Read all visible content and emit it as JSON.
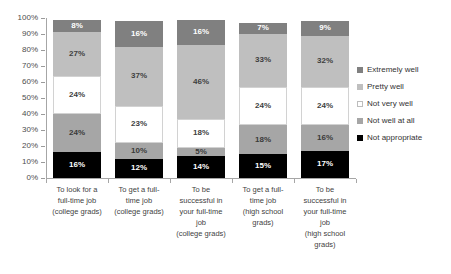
{
  "chart_data": {
    "type": "bar",
    "stacked": true,
    "title": "",
    "subtitle": "",
    "xlabel": "",
    "ylabel": "",
    "ylim": [
      0,
      100
    ],
    "grid": false,
    "legend_position": "right",
    "y_ticks": [
      "0%",
      "10%",
      "20%",
      "30%",
      "40%",
      "50%",
      "60%",
      "70%",
      "80%",
      "90%",
      "100%"
    ],
    "y_tick_values": [
      0,
      10,
      20,
      30,
      40,
      50,
      60,
      70,
      80,
      90,
      100
    ],
    "categories": [
      "To look for a full-time job (college grads)",
      "To get a full-time job (college grads)",
      "To be successful in your full-time job (college grads)",
      "To get a full-time job (high school grads)",
      "To be successful in your full-time job (high school grads)"
    ],
    "category_lines": [
      [
        "To look for a",
        "full-time job",
        "(college grads)"
      ],
      [
        "To get a full-",
        "time job",
        "(college grads)"
      ],
      [
        "To be",
        "successful in",
        "your full-time",
        "job",
        "(college grads)"
      ],
      [
        "To get a full-",
        "time job",
        "(high school",
        "grads)"
      ],
      [
        "To be",
        "successful in",
        "your full-time",
        "job",
        "(high school",
        "grads)"
      ]
    ],
    "series": [
      {
        "name": "Extremely well",
        "color": "#808080",
        "values": [
          8,
          16,
          16,
          7,
          9
        ],
        "labels": [
          "8%",
          "16%",
          "16%",
          "7%",
          "9%"
        ]
      },
      {
        "name": "Pretty well",
        "color": "#bfbfbf",
        "values": [
          27,
          37,
          46,
          33,
          32
        ],
        "labels": [
          "27%",
          "37%",
          "46%",
          "33%",
          "32%"
        ]
      },
      {
        "name": "Not very well",
        "color": "#ffffff",
        "values": [
          24,
          23,
          18,
          24,
          24
        ],
        "labels": [
          "24%",
          "23%",
          "18%",
          "24%",
          "24%"
        ]
      },
      {
        "name": "Not well at all",
        "color": "#a6a6a6",
        "values": [
          24,
          10,
          5,
          18,
          16
        ],
        "labels": [
          "24%",
          "10%",
          "5%",
          "18%",
          "16%"
        ]
      },
      {
        "name": "Not appropriate",
        "color": "#000000",
        "values": [
          16,
          12,
          14,
          15,
          17
        ],
        "labels": [
          "16%",
          "12%",
          "14%",
          "15%",
          "17%"
        ]
      }
    ]
  },
  "legend": {
    "items": [
      {
        "label": "Extremely well",
        "swatch": "sw-dark"
      },
      {
        "label": "Pretty well",
        "swatch": "sw-mid"
      },
      {
        "label": "Not very well",
        "swatch": "sw-white"
      },
      {
        "label": "Not well at all",
        "swatch": "sw-mid2"
      },
      {
        "label": "Not appropriate",
        "swatch": "sw-black"
      }
    ]
  }
}
